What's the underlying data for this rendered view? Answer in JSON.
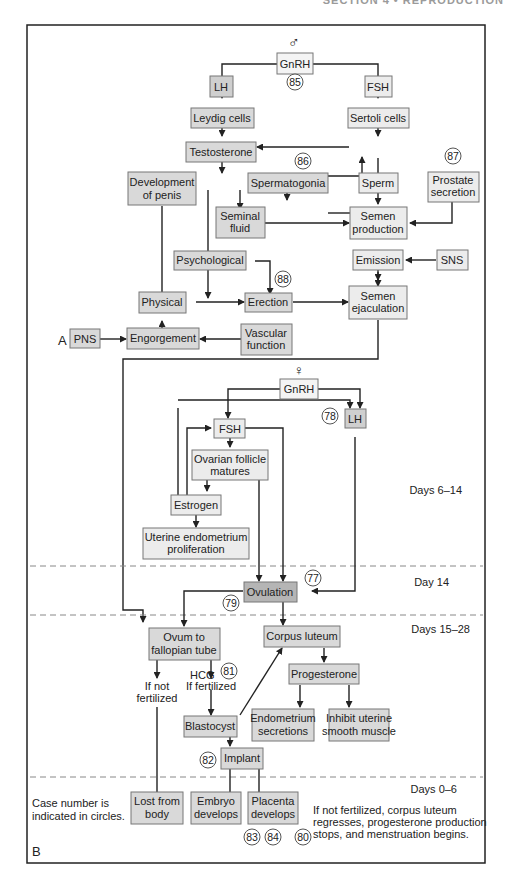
{
  "header": {
    "text": "SECTION 4 • REPRODUCTION"
  },
  "panel_labels": {
    "a": "A",
    "b": "B"
  },
  "symbols": {
    "male": "♂",
    "female": "♀"
  },
  "colors": {
    "box_light": "#ececec",
    "box_mid": "#d9d9d9",
    "box_dark": "#bdbdbd",
    "frame": "#222222",
    "divider": "#888888"
  },
  "male": {
    "gnrh": "GnRH",
    "lh": "LH",
    "fsh": "FSH",
    "leydig": "Leydig cells",
    "sertoli": "Sertoli cells",
    "testosterone": "Testosterone",
    "dev_penis_1": "Development",
    "dev_penis_2": "of penis",
    "spermatogonia": "Spermatogonia",
    "sperm": "Sperm",
    "prostate_1": "Prostate",
    "prostate_2": "secretion",
    "seminal_1": "Seminal",
    "seminal_2": "fluid",
    "semen_prod_1": "Semen",
    "semen_prod_2": "production",
    "psychological": "Psychological",
    "emission": "Emission",
    "sns": "SNS",
    "physical": "Physical",
    "erection": "Erection",
    "semen_ejac_1": "Semen",
    "semen_ejac_2": "ejaculation",
    "pns": "PNS",
    "engorgement": "Engorgement",
    "vascular_1": "Vascular",
    "vascular_2": "function",
    "cases": {
      "c85": "85",
      "c86": "86",
      "c87": "87",
      "c88": "88"
    }
  },
  "female": {
    "gnrh": "GnRH",
    "fsh": "FSH",
    "lh": "LH",
    "follicle_1": "Ovarian follicle",
    "follicle_2": "matures",
    "estrogen": "Estrogen",
    "uterine_1": "Uterine endometrium",
    "uterine_2": "proliferation",
    "ovulation": "Ovulation",
    "ovum_1": "Ovum to",
    "ovum_2": "fallopian tube",
    "corpus": "Corpus luteum",
    "progesterone": "Progesterone",
    "hcg": "HCG",
    "not_fert_1": "If not",
    "not_fert_2": "fertilized",
    "fert": "If fertilized",
    "blastocyst": "Blastocyst",
    "endo_1": "Endometrium",
    "endo_2": "secretions",
    "inhibit_1": "Inhibit uterine",
    "inhibit_2": "smooth muscle",
    "implant": "Implant",
    "lost_1": "Lost from",
    "lost_2": "body",
    "embryo_1": "Embryo",
    "embryo_2": "develops",
    "placenta_1": "Placenta",
    "placenta_2": "develops",
    "cases": {
      "c77": "77",
      "c78": "78",
      "c79": "79",
      "c80": "80",
      "c81": "81",
      "c82": "82",
      "c83": "83",
      "c84": "84"
    }
  },
  "phases": {
    "p1": "Days 6–14",
    "p2": "Day 14",
    "p3": "Days 15–28",
    "p4": "Days 0–6"
  },
  "notes": {
    "legend_1": "Case number is",
    "legend_2": "indicated in circles.",
    "menses_1": "If not fertilized, corpus luteum",
    "menses_2": "regresses, progesterone production",
    "menses_3": "stops, and menstruation begins."
  }
}
